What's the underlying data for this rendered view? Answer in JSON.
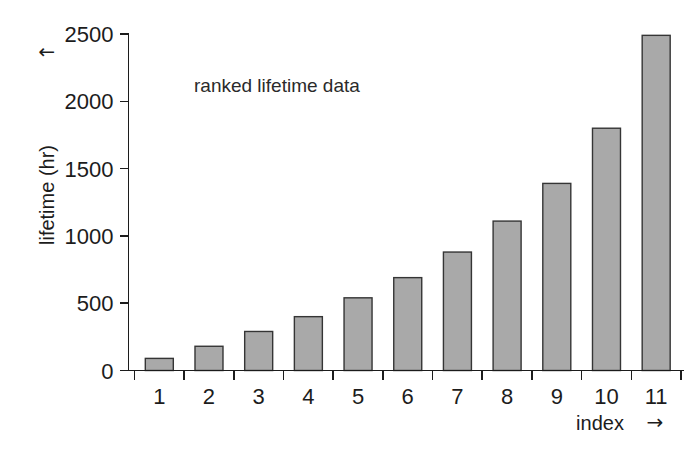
{
  "chart_data": {
    "type": "bar",
    "title": "",
    "annotation": "ranked lifetime data",
    "xlabel": "index",
    "xlabel_arrow": "→",
    "ylabel": "lifetime (hr)",
    "ylabel_arrow": "↑",
    "categories": [
      "1",
      "2",
      "3",
      "4",
      "5",
      "6",
      "7",
      "8",
      "9",
      "10",
      "11"
    ],
    "values": [
      90,
      180,
      290,
      400,
      540,
      690,
      880,
      1110,
      1390,
      1800,
      2490
    ],
    "xlim": [
      0.4,
      11.6
    ],
    "ylim": [
      0,
      2500
    ],
    "yticks": [
      0,
      500,
      1000,
      1500,
      2000,
      2500
    ],
    "ytick_labels": [
      "0",
      "500",
      "1000",
      "1500",
      "2000",
      "2500"
    ],
    "grid": false,
    "legend": false,
    "bar_fill_color": "#a9a9a9",
    "bar_edge_color": "#353535",
    "axis_color": "#1c1c1c",
    "background_color": "#ffffff"
  },
  "figure": {
    "width": 697,
    "height": 451
  }
}
